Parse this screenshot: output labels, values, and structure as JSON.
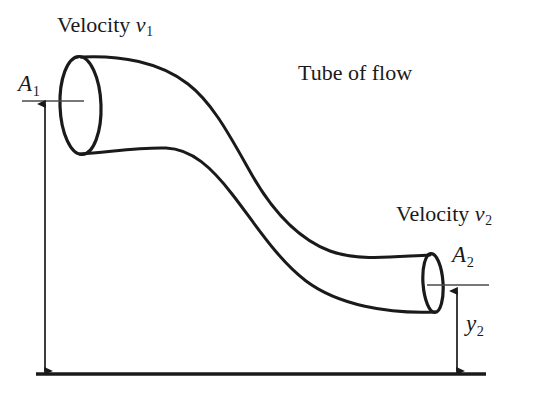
{
  "figure": {
    "title": "Tube of flow",
    "background_color": "#ffffff",
    "stroke_color": "#1a1a1a",
    "width": 535,
    "height": 395
  },
  "labels": {
    "velocity1": "Velocity ",
    "velocity1_symbol": "v",
    "velocity1_subscript": "1",
    "velocity2": "Velocity ",
    "velocity2_symbol": "v",
    "velocity2_subscript": "2",
    "tube_of_flow": "Tube of flow",
    "area1_symbol": "A",
    "area1_subscript": "1",
    "area2_symbol": "A",
    "area2_subscript": "2",
    "height2_symbol": "y",
    "height2_subscript": "2"
  },
  "annotations": {
    "baseline_label": "ground-reference-line",
    "height1_arrow_label": "height-y1-dimension-arrow",
    "height2_arrow_label": "height-y2-dimension-arrow",
    "area1_leader_label": "area-a1-leader-line",
    "area2_leader_label": "area-a2-leader-line"
  }
}
